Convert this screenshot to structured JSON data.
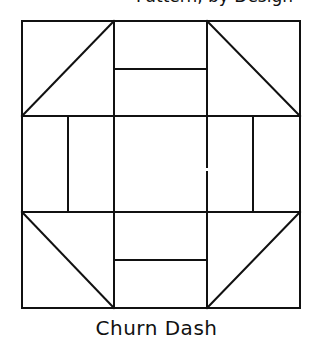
{
  "header": {
    "cutoff_text": "Pattern, by Design"
  },
  "diagram": {
    "name": "Churn Dash",
    "line_color": "#111111",
    "background": "#ffffff",
    "grid": {
      "left": 22,
      "top": 21,
      "right": 300,
      "bottom": 308,
      "col_lines": [
        114,
        207
      ],
      "row_lines": [
        116,
        212
      ]
    }
  },
  "caption": {
    "label": "Churn Dash"
  }
}
